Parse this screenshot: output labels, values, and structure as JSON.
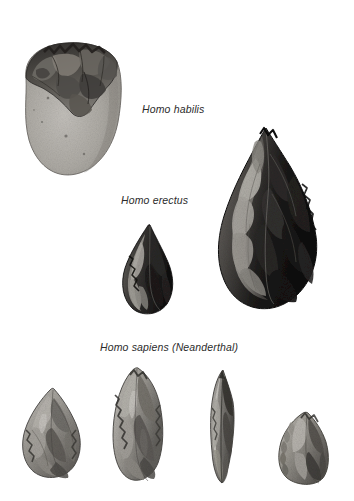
{
  "figure": {
    "background_color": "#ffffff",
    "text_color": "#2b2b2b"
  },
  "labels": [
    {
      "id": "habilis",
      "text": "Homo habilis"
    },
    {
      "id": "erectus",
      "text": "Homo erectus"
    },
    {
      "id": "neanderthal",
      "text": "Homo sapiens (Neanderthal)"
    }
  ],
  "artifacts": [
    {
      "id": "chopper",
      "group": "Homo habilis",
      "icon": "oldowan-chopper-icon",
      "description": "Oldowan chopper, rounded cobble with flaked upper edge",
      "tone_light": "#b5b2ad",
      "tone_mid": "#8a8781",
      "tone_dark": "#3a3835"
    },
    {
      "id": "handaxe-large",
      "group": "Homo erectus",
      "icon": "acheulean-handaxe-icon",
      "description": "Large Acheulean teardrop handaxe, dark flint",
      "tone_light": "#8d8a85",
      "tone_mid": "#4a4744",
      "tone_dark": "#141312"
    },
    {
      "id": "handaxe-small",
      "group": "Homo erectus",
      "icon": "acheulean-point-icon",
      "description": "Smaller dark flaked point",
      "tone_light": "#7e7b76",
      "tone_mid": "#3d3a37",
      "tone_dark": "#111010"
    },
    {
      "id": "mousterian-point",
      "group": "Homo sapiens (Neanderthal)",
      "icon": "mousterian-point-icon",
      "description": "Mousterian point, broad triangular flake",
      "tone_light": "#c0bdb8",
      "tone_mid": "#8f8c86",
      "tone_dark": "#3b3936"
    },
    {
      "id": "mousterian-blade",
      "group": "Homo sapiens (Neanderthal)",
      "icon": "mousterian-blade-icon",
      "description": "Elongated Mousterian blade with retouched edges",
      "tone_light": "#c4c1bc",
      "tone_mid": "#918e88",
      "tone_dark": "#3d3b38"
    },
    {
      "id": "mousterian-borer",
      "group": "Homo sapiens (Neanderthal)",
      "icon": "mousterian-borer-icon",
      "description": "Narrow pointed borer / awl",
      "tone_light": "#b9b6b1",
      "tone_mid": "#7d7a75",
      "tone_dark": "#353331"
    },
    {
      "id": "mousterian-scraper",
      "group": "Homo sapiens (Neanderthal)",
      "icon": "mousterian-scraper-icon",
      "description": "Side scraper with denticulated edge",
      "tone_light": "#bdbab5",
      "tone_mid": "#8b8883",
      "tone_dark": "#393734"
    }
  ]
}
